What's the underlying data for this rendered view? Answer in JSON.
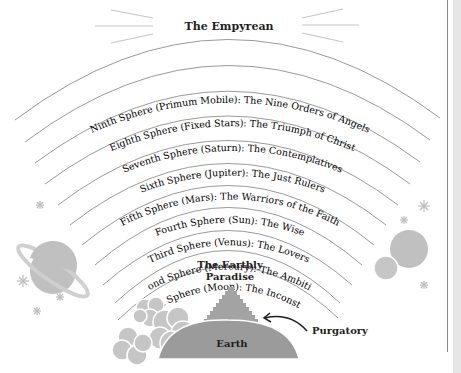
{
  "title": "The Empyrean",
  "spheres": [
    {
      "name": "Ninth Sphere (Primum Mobile):",
      "desc": "The Nine Orders of Angels"
    },
    {
      "name": "Eighth Sphere (Fixed Stars):",
      "desc": "The Triumph of Christ"
    },
    {
      "name": "Seventh Sphere (Saturn):",
      "desc": "The Contemplatives"
    },
    {
      "name": "Sixth Sphere (Jupiter):",
      "desc": "The Just Rulers"
    },
    {
      "name": "Fifth Sphere (Mars):",
      "desc": "The Warriors of the Faith"
    },
    {
      "name": "Fourth Sphere (Sun):",
      "desc": "The Wise"
    },
    {
      "name": "Third Sphere (Venus):",
      "desc": "The Lovers"
    },
    {
      "name": "Second Sphere (Mercury):",
      "desc": "The Ambitious"
    },
    {
      "name": "First Sphere (Moon):",
      "desc": "The Inconstant"
    }
  ],
  "earthly_paradise": {
    "line1": "The Earthly",
    "line2": "Paradise"
  },
  "purgatory": "Purgatory",
  "earth": "Earth",
  "colors": {
    "arc": "#9a9a9a",
    "earth": "#9b9b9b",
    "mountain": "#a3a3a3",
    "cloud": "#c6c6c6",
    "planet": "#c0c0c0",
    "star": "#bdbdbd",
    "label_bold": "#1e1e1e",
    "label_light": "#7a7a7a"
  }
}
